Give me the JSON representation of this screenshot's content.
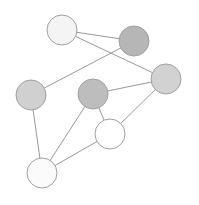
{
  "diagram": {
    "type": "graph",
    "edge_color": "#9a9a9a",
    "stroke_color": "#a0a0a0",
    "nodes": [
      {
        "id": "A",
        "cx": 62,
        "cy": 30,
        "r": 15,
        "fill": "#f4f4f4"
      },
      {
        "id": "B",
        "cx": 134,
        "cy": 41,
        "r": 15,
        "fill": "#b6b6b6"
      },
      {
        "id": "C",
        "cx": 166,
        "cy": 79,
        "r": 15,
        "fill": "#d2d2d2"
      },
      {
        "id": "D",
        "cx": 31,
        "cy": 95,
        "r": 15,
        "fill": "#d0d0d0"
      },
      {
        "id": "E",
        "cx": 93,
        "cy": 94,
        "r": 15,
        "fill": "#bdbdbd"
      },
      {
        "id": "F",
        "cx": 110,
        "cy": 134,
        "r": 15,
        "fill": "#ffffff"
      },
      {
        "id": "G",
        "cx": 42,
        "cy": 173,
        "r": 15,
        "fill": "#fbfbfb"
      }
    ],
    "edges": [
      [
        "A",
        "B"
      ],
      [
        "A",
        "C"
      ],
      [
        "B",
        "D"
      ],
      [
        "E",
        "C"
      ],
      [
        "E",
        "F"
      ],
      [
        "C",
        "F"
      ],
      [
        "E",
        "G"
      ],
      [
        "F",
        "G"
      ],
      [
        "D",
        "G"
      ]
    ]
  }
}
